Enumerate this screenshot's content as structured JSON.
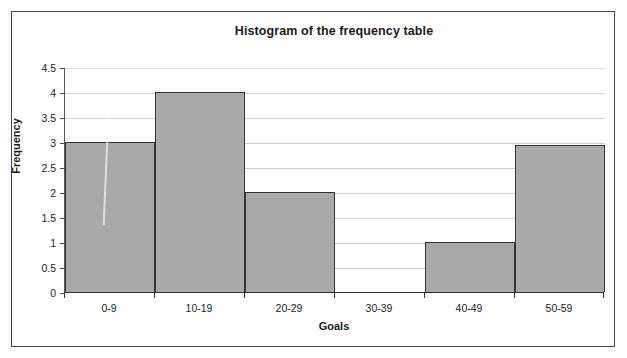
{
  "chart_data": {
    "type": "bar",
    "title": "Histogram of the frequency table",
    "xlabel": "Goals",
    "ylabel": "Frequency",
    "categories": [
      "0-9",
      "10-19",
      "20-29",
      "30-39",
      "40-49",
      "50-59"
    ],
    "values": [
      3,
      4,
      2,
      0,
      1,
      3
    ],
    "ylim": [
      0,
      4.5
    ],
    "ytick_labels": [
      "0",
      "0.5",
      "1",
      "1.5",
      "2",
      "2.5",
      "3",
      "3.5",
      "4",
      "4.5"
    ],
    "ytick_values": [
      0,
      0.5,
      1,
      1.5,
      2,
      2.5,
      3,
      3.5,
      4,
      4.5
    ],
    "grid": true,
    "legend": "none",
    "bar_fill_color": "#a9a9a9",
    "bar_border_color": "#343434",
    "gridline_color": "#cfcfcf",
    "frame_color": "#4a4a4a",
    "text_color": "#1b1b1b"
  }
}
